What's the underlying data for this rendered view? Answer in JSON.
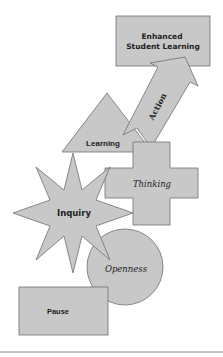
{
  "diagram": {
    "colors": {
      "fill": "#c8c8c8",
      "stroke": "#6e6e6e",
      "text": "#222222",
      "background": "#ffffff",
      "rule": "#888888"
    },
    "nodes": {
      "enhanced": {
        "line1": "Enhanced",
        "line2": "Student Learning",
        "shape": "rectangle"
      },
      "action": {
        "label": "Action",
        "shape": "arrow"
      },
      "learning": {
        "label": "Learning",
        "shape": "triangle"
      },
      "thinking": {
        "label": "Thinking",
        "shape": "cross"
      },
      "inquiry": {
        "label": "Inquiry",
        "shape": "star"
      },
      "openness": {
        "label": "Openness",
        "shape": "circle"
      },
      "pause": {
        "label": "Pause",
        "shape": "rectangle"
      }
    }
  }
}
